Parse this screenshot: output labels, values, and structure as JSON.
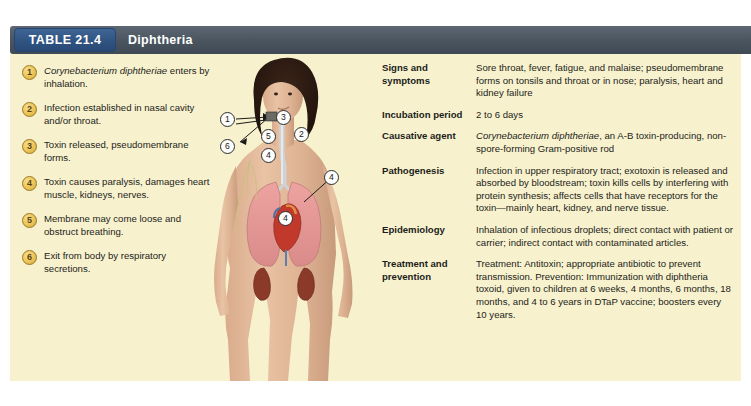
{
  "header": {
    "badge_label": "TABLE 21.4",
    "title": "Diphtheria",
    "badge_color": "#2f5280",
    "bar_color": "#49545f"
  },
  "panel": {
    "background_color": "#f7f2cd"
  },
  "steps": [
    {
      "number": "1",
      "text_italic": "Corynebacterium diphtheriae",
      "text_rest": " enters by inhalation."
    },
    {
      "number": "2",
      "text_italic": "",
      "text_rest": "Infection established in nasal cavity and/or throat."
    },
    {
      "number": "3",
      "text_italic": "",
      "text_rest": "Toxin released, pseudomembrane forms."
    },
    {
      "number": "4",
      "text_italic": "",
      "text_rest": "Toxin causes paralysis, damages heart muscle, kidneys, nerves."
    },
    {
      "number": "5",
      "text_italic": "",
      "text_rest": "Membrane may come loose and obstruct breathing."
    },
    {
      "number": "6",
      "text_italic": "",
      "text_rest": "Exit from body by respiratory secretions."
    }
  ],
  "figure": {
    "callouts": [
      {
        "number": "1",
        "x": 14,
        "y": 58
      },
      {
        "number": "6",
        "x": 14,
        "y": 85
      },
      {
        "number": "3",
        "x": 70,
        "y": 56
      },
      {
        "number": "5",
        "x": 55,
        "y": 75
      },
      {
        "number": "2",
        "x": 88,
        "y": 73
      },
      {
        "number": "4",
        "x": 55,
        "y": 94
      },
      {
        "number": "4",
        "x": 118,
        "y": 116
      },
      {
        "number": "4",
        "x": 72,
        "y": 157
      }
    ]
  },
  "details": [
    {
      "label": "Signs and symptoms",
      "value_italic": "",
      "value": "Sore throat, fever, fatigue, and malaise; pseudomembrane forms on tonsils and throat or in nose; paralysis, heart and kidney failure"
    },
    {
      "label": "Incubation period",
      "value_italic": "",
      "value": "2 to 6 days"
    },
    {
      "label": "Causative agent",
      "value_italic": "Corynebacterium diphtheriae",
      "value": ", an A-B toxin-producing, non-spore-forming Gram-positive rod"
    },
    {
      "label": "Pathogenesis",
      "value_italic": "",
      "value": "Infection in upper respiratory tract; exotoxin is released and absorbed by bloodstream; toxin kills cells by interfering with protein synthesis; affects cells that have receptors for the toxin—mainly heart, kidney, and nerve tissue."
    },
    {
      "label": "Epidemiology",
      "value_italic": "",
      "value": "Inhalation of infectious droplets; direct contact with patient or carrier; indirect contact with contaminated articles."
    },
    {
      "label": "Treatment and prevention",
      "value_italic": "",
      "value": "Treatment: Antitoxin; appropriate antibiotic to prevent transmission. Prevention: Immunization with diphtheria toxoid, given to children at 6 weeks, 4 months, 6 months, 18 months, and 4 to 6 years in DTaP vaccine; boosters every 10 years."
    }
  ]
}
